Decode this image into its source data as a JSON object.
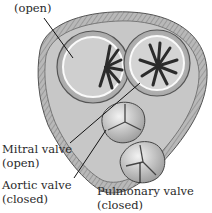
{
  "figure": {
    "labels": [
      {
        "id": "tricuspid",
        "line1": "",
        "line2": "(open)"
      },
      {
        "id": "mitral",
        "line1": "Mitral valve",
        "line2": "(open)"
      },
      {
        "id": "aortic",
        "line1": "Aortic valve",
        "line2": "(closed)"
      },
      {
        "id": "pulmonary",
        "line1": "Pulmonary valve",
        "line2": "(closed)"
      }
    ]
  }
}
